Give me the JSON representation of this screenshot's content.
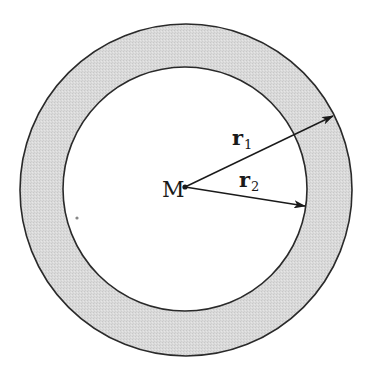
{
  "diagram": {
    "center_label": "M",
    "radius_outer": {
      "symbol": "r",
      "subscript": "1"
    },
    "radius_inner": {
      "symbol": "r",
      "subscript": "2"
    },
    "colors": {
      "shell_fill": "#d9d9d9",
      "stroke": "#2a2a2a",
      "background": "#ffffff"
    }
  }
}
